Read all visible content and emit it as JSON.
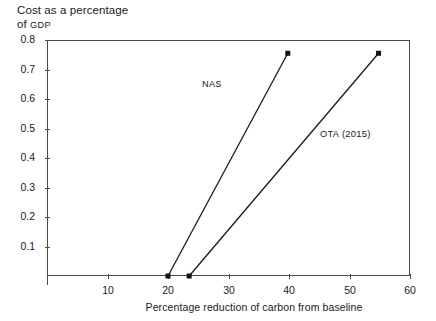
{
  "chart_data": {
    "type": "line",
    "title": "Cost as a percentage of GDP",
    "title_line1": "Cost as a percentage",
    "title_line2_prefix": "of ",
    "title_line2_smallcaps": "GDP",
    "xlabel": "Percentage reduction of carbon from baseline",
    "ylabel": "Cost as a percentage of GDP",
    "xlim": [
      0,
      60
    ],
    "ylim": [
      0,
      0.8
    ],
    "grid": false,
    "legend_position": "inline-annotation",
    "xticks": [
      10,
      20,
      30,
      40,
      50,
      60
    ],
    "xtick_labels": [
      "10",
      "20",
      "30",
      "40",
      "50",
      "60"
    ],
    "yticks": [
      0.1,
      0.2,
      0.3,
      0.4,
      0.5,
      0.6,
      0.7,
      0.8
    ],
    "ytick_labels": [
      "0.1",
      "0.2",
      "0.3",
      "0.4",
      "0.5",
      "0.6",
      "0.7",
      "0.8"
    ],
    "series": [
      {
        "name": "NAS",
        "label": "NAS",
        "label_smallcaps": true,
        "color": "#1a1a1a",
        "marker": "square",
        "x": [
          20,
          39.8
        ],
        "y": [
          0,
          0.755
        ],
        "annotation_x": 202,
        "annotation_y": 78
      },
      {
        "name": "OTA (2015)",
        "label_smallcaps_part": "OTA",
        "label_rest": " (2015)",
        "color": "#1a1a1a",
        "marker": "square",
        "x": [
          23.5,
          54.8
        ],
        "y": [
          0,
          0.755
        ],
        "annotation_x": 320,
        "annotation_y": 128
      }
    ],
    "intersection": {
      "x": 27.0,
      "y": 0.155
    }
  },
  "colors": {
    "axis": "#4a4a4a",
    "line": "#1a1a1a",
    "marker": "#111111",
    "background": "#ffffff",
    "text": "#1a1a1a"
  },
  "geometry": {
    "plot_left": 47,
    "plot_top": 40,
    "plot_right": 410,
    "plot_bottom": 276
  }
}
